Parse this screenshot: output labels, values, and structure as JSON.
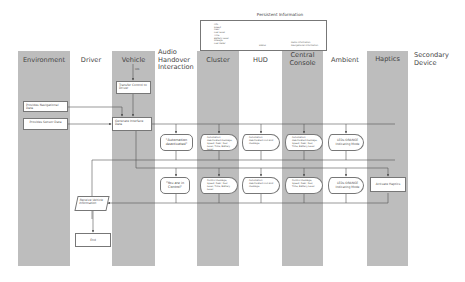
{
  "persistent": {
    "title": "Persistent Information",
    "left_items": [
      "Info",
      "Speed",
      "Gear",
      "Fuel Level",
      "Time",
      "Battery Level",
      "Mileage",
      "Fuel Meter"
    ],
    "middle_item": "Status",
    "right_items": [
      "Radio Information",
      "Navigational Information"
    ]
  },
  "lanes": [
    {
      "label": "Environment",
      "shaded": true
    },
    {
      "label": "Driver",
      "shaded": false
    },
    {
      "label": "Vehicle",
      "shaded": true
    },
    {
      "label": "Audio Handover Interaction",
      "shaded": false
    },
    {
      "label": "Cluster",
      "shaded": true
    },
    {
      "label": "HUD",
      "shaded": false
    },
    {
      "label": "Central Console",
      "shaded": true
    },
    {
      "label": "Ambient",
      "shaded": false
    },
    {
      "label": "Haptics",
      "shaded": true
    },
    {
      "label": "Secondary Device",
      "shaded": false
    }
  ],
  "lane_labels": {
    "environment": "Environment",
    "driver": "Driver",
    "vehicle": "Vehicle",
    "audio_1": "Audio",
    "audio_2": "Handover",
    "audio_3": "Interaction",
    "cluster": "Cluster",
    "hud": "HUD",
    "central_1": "Central",
    "central_2": "Console",
    "ambient": "Ambient",
    "haptics": "Haptics",
    "secondary_1": "Secondary",
    "secondary_2": "Device"
  },
  "nodes": {
    "vehicle_start_label": "tdb",
    "transfer_control": "Transfer Control to Driver",
    "provide_nav": "Provides Navigational Data",
    "provide_sensor": "Provides Sensor Data",
    "generate_interface": "Generate Interface Data",
    "audio_1": "\"Automation deactivated\"",
    "audio_2": "\"You are in Control\"",
    "cluster_1": "Automation deactivated message, Speed, Gear, Fuel Level, Time, Battery Level",
    "cluster_2": "Control message, Speed, Gear, Fuel Level, Time, Battery Level",
    "hud_1": "Automation deactivated icon and message",
    "hud_2": "Automation deactivated icon and message",
    "console_1": "Automation deactivated message, Speed, Gear, Fuel, Time, Battery Level",
    "console_2": "Control message, Speed, Gear, Fuel, Time, Battery Level",
    "ambient_1": "LEDs ORANGE Indicating Mode",
    "ambient_2": "LEDs ORANGE Indicating Mode",
    "activate_haptics": "Activate Haptics",
    "receive_vehicle_info": "Receive Vehicle Information",
    "end": "End"
  }
}
